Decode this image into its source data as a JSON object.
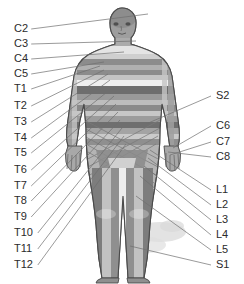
{
  "diagram": {
    "background_color": "#ffffff",
    "leader_line_color": "#6e6e6e",
    "label_color": "#2b2b2b",
    "figure": {
      "name": "human-body-anterior",
      "skin_color": "#b8b8b8",
      "outline_color": "#4a4a4a",
      "band_colors": [
        "#8f8f8f",
        "#c9c9c9",
        "#6e6e6e",
        "#a8a8a8",
        "#dcdcdc"
      ],
      "shadow_color": "#d6d6d6"
    },
    "left_labels": [
      {
        "id": "C2",
        "text": "C2",
        "x": 14,
        "y": 29,
        "target_x": 148,
        "target_y": 14
      },
      {
        "id": "C3",
        "text": "C3",
        "x": 14,
        "y": 44,
        "target_x": 136,
        "target_y": 41
      },
      {
        "id": "C4",
        "text": "C4",
        "x": 14,
        "y": 59,
        "target_x": 124,
        "target_y": 52
      },
      {
        "id": "C5",
        "text": "C5",
        "x": 14,
        "y": 74,
        "target_x": 104,
        "target_y": 62
      },
      {
        "id": "T1",
        "text": "T1",
        "x": 14,
        "y": 89,
        "target_x": 100,
        "target_y": 66
      },
      {
        "id": "T2",
        "text": "T2",
        "x": 14,
        "y": 106,
        "target_x": 104,
        "target_y": 70
      },
      {
        "id": "T3",
        "text": "T3",
        "x": 14,
        "y": 122,
        "target_x": 108,
        "target_y": 74
      },
      {
        "id": "T4",
        "text": "T4",
        "x": 14,
        "y": 138,
        "target_x": 110,
        "target_y": 80
      },
      {
        "id": "T5",
        "text": "T5",
        "x": 14,
        "y": 153,
        "target_x": 112,
        "target_y": 88
      },
      {
        "id": "T6",
        "text": "T6",
        "x": 14,
        "y": 170,
        "target_x": 114,
        "target_y": 96
      },
      {
        "id": "T7",
        "text": "T7",
        "x": 14,
        "y": 186,
        "target_x": 116,
        "target_y": 104
      },
      {
        "id": "T8",
        "text": "T8",
        "x": 14,
        "y": 201,
        "target_x": 118,
        "target_y": 112
      },
      {
        "id": "T9",
        "text": "T9",
        "x": 14,
        "y": 217,
        "target_x": 120,
        "target_y": 120
      },
      {
        "id": "T10",
        "text": "T10",
        "x": 14,
        "y": 233,
        "target_x": 122,
        "target_y": 128
      },
      {
        "id": "T11",
        "text": "T11",
        "x": 14,
        "y": 249,
        "target_x": 124,
        "target_y": 136
      },
      {
        "id": "T12",
        "text": "T12",
        "x": 14,
        "y": 265,
        "target_x": 126,
        "target_y": 144
      }
    ],
    "right_labels": [
      {
        "id": "S2",
        "text": "S2",
        "x": 216,
        "y": 96,
        "target_x": 146,
        "target_y": 124
      },
      {
        "id": "C6",
        "text": "C6",
        "x": 216,
        "y": 126,
        "target_x": 173,
        "target_y": 148
      },
      {
        "id": "C7",
        "text": "C7",
        "x": 216,
        "y": 142,
        "target_x": 170,
        "target_y": 155
      },
      {
        "id": "C8",
        "text": "C8",
        "x": 216,
        "y": 157,
        "target_x": 168,
        "target_y": 152
      },
      {
        "id": "L1",
        "text": "L1",
        "x": 216,
        "y": 190,
        "target_x": 150,
        "target_y": 150
      },
      {
        "id": "L2",
        "text": "L2",
        "x": 216,
        "y": 205,
        "target_x": 148,
        "target_y": 158
      },
      {
        "id": "L3",
        "text": "L3",
        "x": 216,
        "y": 220,
        "target_x": 144,
        "target_y": 166
      },
      {
        "id": "L4",
        "text": "L4",
        "x": 216,
        "y": 235,
        "target_x": 140,
        "target_y": 176
      },
      {
        "id": "L5",
        "text": "L5",
        "x": 216,
        "y": 250,
        "target_x": 136,
        "target_y": 196
      },
      {
        "id": "S1",
        "text": "S1",
        "x": 216,
        "y": 265,
        "target_x": 130,
        "target_y": 246
      }
    ]
  }
}
